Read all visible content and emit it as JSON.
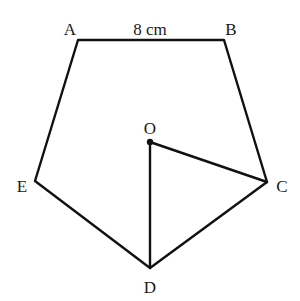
{
  "diagram": {
    "type": "regular-pentagon",
    "vertices": [
      {
        "name": "A",
        "x": 78,
        "y": 40,
        "label_x": 70,
        "label_y": 35
      },
      {
        "name": "B",
        "x": 224,
        "y": 40,
        "label_x": 231,
        "label_y": 35
      },
      {
        "name": "C",
        "x": 267,
        "y": 182,
        "label_x": 276,
        "label_y": 192
      },
      {
        "name": "D",
        "x": 150,
        "y": 268,
        "label_x": 150,
        "label_y": 292
      },
      {
        "name": "E",
        "x": 35,
        "y": 181,
        "label_x": 22,
        "label_y": 191
      }
    ],
    "center": {
      "name": "O",
      "x": 150,
      "y": 142,
      "label_x": 150,
      "label_y": 134
    },
    "side_label": {
      "text": "8 cm",
      "x": 151,
      "y": 35
    },
    "labels": {
      "A": "A",
      "B": "B",
      "C": "C",
      "D": "D",
      "E": "E",
      "O": "O",
      "side": "8 cm"
    },
    "segments": [
      "AB",
      "BC",
      "CD",
      "DE",
      "EA",
      "OC",
      "OD"
    ],
    "line_color": "#111111"
  }
}
